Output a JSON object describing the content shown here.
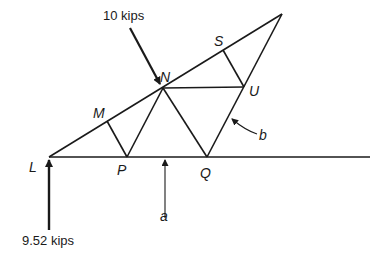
{
  "diagram": {
    "type": "truss",
    "nodes": {
      "L": {
        "label": "L",
        "x": 49,
        "y": 157
      },
      "M": {
        "label": "M",
        "x": 107,
        "y": 121
      },
      "N": {
        "label": "N",
        "x": 163,
        "y": 88
      },
      "P": {
        "label": "P",
        "x": 127,
        "y": 157
      },
      "Q": {
        "label": "Q",
        "x": 207,
        "y": 157
      },
      "S": {
        "label": "S",
        "x": 223,
        "y": 50
      },
      "U": {
        "label": "U",
        "x": 244,
        "y": 87
      },
      "apex": {
        "x": 282,
        "y": 14
      }
    },
    "loads": {
      "top_load": "10 kips",
      "reaction": "9.52 kips"
    },
    "section_labels": {
      "a": "a",
      "b": "b"
    }
  }
}
